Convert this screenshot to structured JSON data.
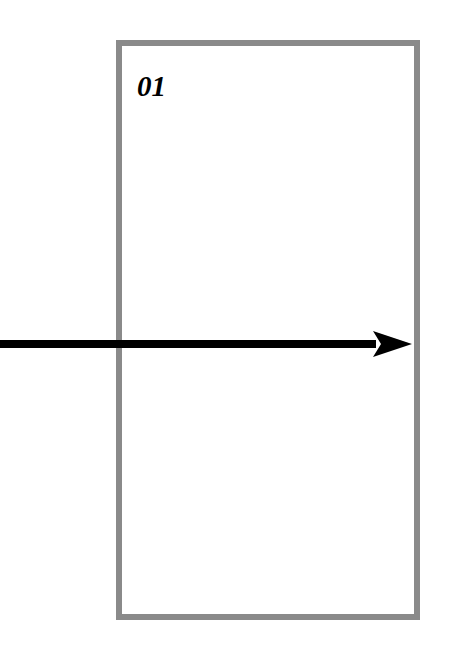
{
  "canvas": {
    "width": 449,
    "height": 653,
    "background_color": "#ffffff"
  },
  "slide": {
    "number_label": "01",
    "number_color": "#000000"
  },
  "frame": {
    "name": "rectangle-outline",
    "stroke_color": "#8a8a8a",
    "fill_color": "#ffffff",
    "stroke_width": 6,
    "x": 119,
    "y": 43,
    "width": 298,
    "height": 574
  },
  "arrow": {
    "name": "right-pointing-arrow",
    "color": "#000000",
    "shaft_thickness": 8,
    "start_x": 0,
    "end_x": 412,
    "center_y": 344,
    "head_length": 39,
    "head_height": 26,
    "direction": "right"
  }
}
